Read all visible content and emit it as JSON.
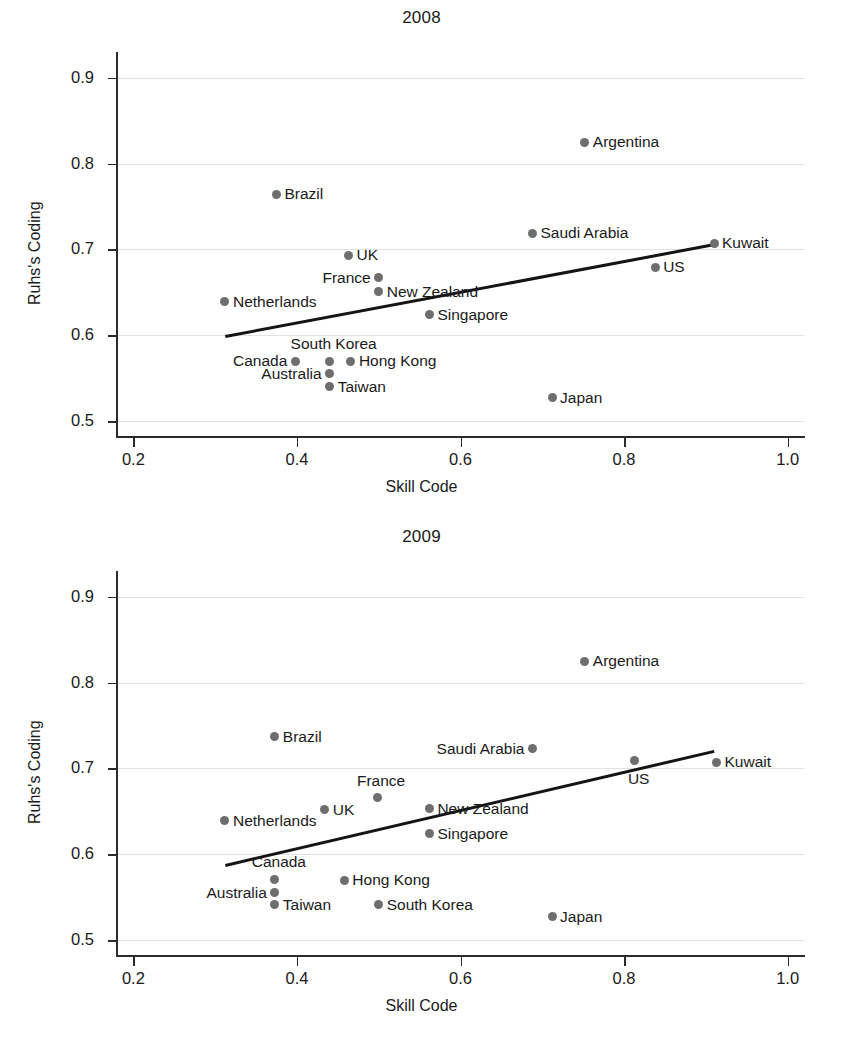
{
  "figure": {
    "xlabel": "Skill Code",
    "ylabel": "Ruhs's Coding",
    "point_color": "#6e6e6e",
    "line_color": "#141414",
    "grid_color": "#e2e2e2"
  },
  "chart_data": [
    {
      "type": "scatter",
      "title": "2008",
      "xlabel": "Skill Code",
      "ylabel": "Ruhs's Coding",
      "xlim": [
        0.18,
        1.02
      ],
      "ylim": [
        0.485,
        0.93
      ],
      "xticks": [
        0.2,
        0.4,
        0.6,
        0.8,
        1.0
      ],
      "xtick_labels": [
        "0.2",
        "0.4",
        "0.6",
        "0.8",
        "1.0"
      ],
      "yticks": [
        0.5,
        0.6,
        0.7,
        0.8,
        0.9
      ],
      "ytick_labels": [
        "0.5",
        "0.6",
        "0.7",
        "0.8",
        "0.9"
      ],
      "grid": true,
      "legend": "none",
      "points": [
        {
          "label": "Argentina",
          "x": 0.752,
          "y": 0.825,
          "side": "right"
        },
        {
          "label": "Brazil",
          "x": 0.375,
          "y": 0.764,
          "side": "right"
        },
        {
          "label": "Saudi Arabia",
          "x": 0.688,
          "y": 0.719,
          "side": "right"
        },
        {
          "label": "Kuwait",
          "x": 0.91,
          "y": 0.707,
          "side": "right"
        },
        {
          "label": "UK",
          "x": 0.463,
          "y": 0.693,
          "side": "right"
        },
        {
          "label": "US",
          "x": 0.838,
          "y": 0.679,
          "side": "right"
        },
        {
          "label": "France",
          "x": 0.5,
          "y": 0.667,
          "side": "left"
        },
        {
          "label": "New Zealand",
          "x": 0.5,
          "y": 0.651,
          "side": "right"
        },
        {
          "label": "Netherlands",
          "x": 0.312,
          "y": 0.639,
          "side": "right"
        },
        {
          "label": "Singapore",
          "x": 0.562,
          "y": 0.624,
          "side": "right"
        },
        {
          "label": "South Korea",
          "x": 0.44,
          "y": 0.57,
          "side": "above"
        },
        {
          "label": "Hong Kong",
          "x": 0.466,
          "y": 0.57,
          "side": "right"
        },
        {
          "label": "Canada",
          "x": 0.398,
          "y": 0.57,
          "side": "left"
        },
        {
          "label": "Australia",
          "x": 0.44,
          "y": 0.555,
          "side": "left"
        },
        {
          "label": "Taiwan",
          "x": 0.44,
          "y": 0.54,
          "side": "right"
        },
        {
          "label": "Japan",
          "x": 0.712,
          "y": 0.527,
          "side": "right"
        }
      ],
      "fit_line": {
        "x0": 0.312,
        "y0": 0.6,
        "x1": 0.91,
        "y1": 0.707
      }
    },
    {
      "type": "scatter",
      "title": "2009",
      "xlabel": "Skill Code",
      "ylabel": "Ruhs's Coding",
      "xlim": [
        0.18,
        1.02
      ],
      "ylim": [
        0.485,
        0.93
      ],
      "xticks": [
        0.2,
        0.4,
        0.6,
        0.8,
        1.0
      ],
      "xtick_labels": [
        "0.2",
        "0.4",
        "0.6",
        "0.8",
        "1.0"
      ],
      "yticks": [
        0.5,
        0.6,
        0.7,
        0.8,
        0.9
      ],
      "ytick_labels": [
        "0.5",
        "0.6",
        "0.7",
        "0.8",
        "0.9"
      ],
      "grid": true,
      "legend": "none",
      "points": [
        {
          "label": "Argentina",
          "x": 0.752,
          "y": 0.825,
          "side": "right"
        },
        {
          "label": "Brazil",
          "x": 0.373,
          "y": 0.737,
          "side": "right"
        },
        {
          "label": "Saudi Arabia",
          "x": 0.688,
          "y": 0.723,
          "side": "left"
        },
        {
          "label": "US",
          "x": 0.813,
          "y": 0.709,
          "side": "below"
        },
        {
          "label": "Kuwait",
          "x": 0.913,
          "y": 0.707,
          "side": "right"
        },
        {
          "label": "France",
          "x": 0.498,
          "y": 0.666,
          "side": "above"
        },
        {
          "label": "New Zealand",
          "x": 0.562,
          "y": 0.653,
          "side": "right"
        },
        {
          "label": "UK",
          "x": 0.434,
          "y": 0.652,
          "side": "right"
        },
        {
          "label": "Netherlands",
          "x": 0.312,
          "y": 0.639,
          "side": "right"
        },
        {
          "label": "Singapore",
          "x": 0.562,
          "y": 0.624,
          "side": "right"
        },
        {
          "label": "Canada",
          "x": 0.373,
          "y": 0.571,
          "side": "above"
        },
        {
          "label": "Hong Kong",
          "x": 0.458,
          "y": 0.57,
          "side": "right"
        },
        {
          "label": "Australia",
          "x": 0.373,
          "y": 0.555,
          "side": "left"
        },
        {
          "label": "Taiwan",
          "x": 0.373,
          "y": 0.541,
          "side": "right"
        },
        {
          "label": "South Korea",
          "x": 0.5,
          "y": 0.541,
          "side": "right"
        },
        {
          "label": "Japan",
          "x": 0.712,
          "y": 0.527,
          "side": "right"
        }
      ],
      "fit_line": {
        "x0": 0.312,
        "y0": 0.589,
        "x1": 0.91,
        "y1": 0.722
      }
    }
  ]
}
